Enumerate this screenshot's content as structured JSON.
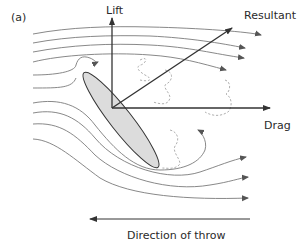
{
  "diagram": {
    "panel_label": "(a)",
    "forces": {
      "lift": "Lift",
      "resultant": "Resultant",
      "drag": "Drag"
    },
    "direction_label": "Direction of throw",
    "colors": {
      "stroke": "#333333",
      "streamline": "#7a7a7a",
      "body_fill": "#dcdcdc",
      "vortex": "#9a9a9a"
    }
  }
}
